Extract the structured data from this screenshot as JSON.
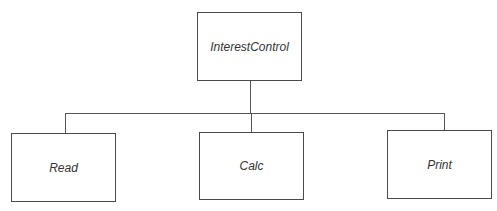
{
  "diagram": {
    "type": "hierarchy",
    "root": {
      "label": "InterestControl",
      "box": {
        "x": 197,
        "y": 12,
        "w": 105,
        "h": 69
      }
    },
    "children": [
      {
        "label": "Read",
        "box": {
          "x": 11,
          "y": 133,
          "w": 105,
          "h": 69
        },
        "connector_x": 65
      },
      {
        "label": "Calc",
        "box": {
          "x": 199,
          "y": 132,
          "w": 105,
          "h": 68
        },
        "connector_x": 251
      },
      {
        "label": "Print",
        "box": {
          "x": 387,
          "y": 130,
          "w": 105,
          "h": 69
        },
        "connector_x": 444
      }
    ],
    "bus_y": 113,
    "line_color": "#555555",
    "border_color": "#4a4a4a"
  }
}
